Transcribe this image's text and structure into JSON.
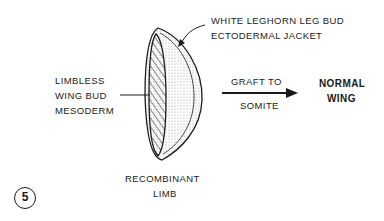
{
  "labels": {
    "ectoderm_line1": "WHITE LEGHORN LEG BUD",
    "ectoderm_line2": "ECTODERMAL JACKET",
    "mesoderm_line1": "LIMBLESS",
    "mesoderm_line2": "WING BUD",
    "mesoderm_line3": "MESODERM",
    "graft_line1": "GRAFT TO",
    "graft_line2": "SOMITE",
    "result_line1": "NORMAL",
    "result_line2": "WING",
    "recombinant_line1": "RECOMBINANT",
    "recombinant_line2": "LIMB"
  },
  "figure_number": "5"
}
